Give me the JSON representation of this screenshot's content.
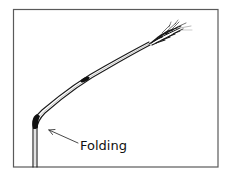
{
  "diagram": {
    "labels": {
      "folding": "Folding"
    },
    "parts": {
      "stem": "stem",
      "lower_node": "folding node",
      "upper_node": "stem node",
      "ear": "wheat ear (spike)",
      "arrow": "pointer arrow"
    },
    "colors": {
      "line": "#1a1a1a",
      "frame": "#5a5a5a",
      "node": "#111111",
      "background": "#ffffff"
    }
  }
}
